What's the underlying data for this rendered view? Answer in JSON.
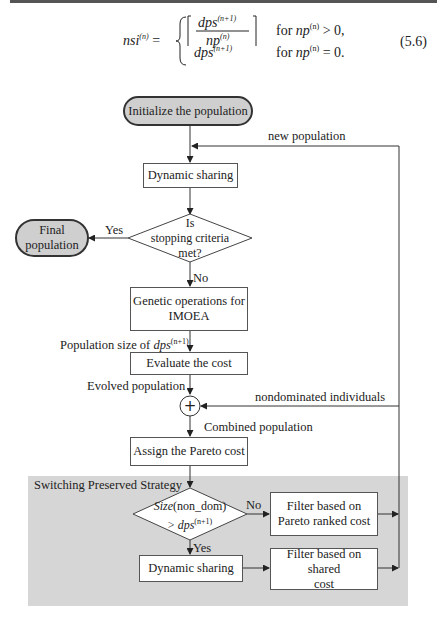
{
  "equation": {
    "lhs": "nsi",
    "lhs_sup": "(n)",
    "case1_numerator": "dps",
    "case1_numerator_sup": "(n+1)",
    "case1_denominator": "np",
    "case1_denominator_sup": "(n)",
    "case1_condition_prefix": "for ",
    "case1_condition_var": "np",
    "case1_condition_sup": "(n)",
    "case1_condition_suffix": " > 0,",
    "case2_value": "dps",
    "case2_value_sup": "(n+1)",
    "case2_condition_prefix": "for ",
    "case2_condition_var": "np",
    "case2_condition_sup": "(n)",
    "case2_condition_suffix": " = 0.",
    "number": "(5.6)"
  },
  "flowchart": {
    "start": "Initialize the population",
    "new_population_label": "new population",
    "dynamic_sharing_1": "Dynamic sharing",
    "decision_1": [
      "Is",
      "stopping criteria",
      "met?"
    ],
    "yes_label_1": "Yes",
    "final": [
      "Final",
      "population"
    ],
    "no_label_1": "No",
    "genetic_ops": [
      "Genetic operations for",
      "IMOEA"
    ],
    "pop_size_label_prefix": "Population size of ",
    "pop_size_label_var": "dps",
    "pop_size_label_sup": "(n+1)",
    "evaluate": "Evaluate the cost",
    "evolved_label": "Evolved population",
    "combine_symbol": "+",
    "nondominated_label": "nondominated individuals",
    "combined_label": "Combined population",
    "assign": "Assign the Pareto cost",
    "region_title": "Switching Preserved Strategy",
    "decision_2_line1_italic": "Size",
    "decision_2_line1_rest": "(non_dom)",
    "decision_2_line2_prefix": "> ",
    "decision_2_line2_var": "dps",
    "decision_2_line2_sup": "(n+1)",
    "no_label_2": "No",
    "yes_label_2": "Yes",
    "filter_pareto": [
      "Filter based on",
      "Pareto ranked cost"
    ],
    "dynamic_sharing_2": "Dynamic sharing",
    "filter_shared": [
      "Filter based on shared",
      "cost"
    ]
  },
  "colors": {
    "terminator_fill": "#cfcfcf",
    "region_fill": "#d6d6d6",
    "line": "#333333"
  }
}
